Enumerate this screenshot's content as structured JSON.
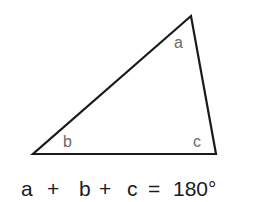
{
  "diagram": {
    "triangle": {
      "vertices": {
        "top": [
          191,
          16
        ],
        "bottom_left": [
          33,
          154
        ],
        "bottom_right": [
          216,
          154
        ]
      },
      "stroke_color": "#1a1a1a",
      "angle_label_color": "#6a6a6a"
    },
    "labels": {
      "a": "a",
      "b": "b",
      "c": "c"
    },
    "equation": {
      "text": "a + b + c = 180°",
      "a": "a",
      "plus1": "+",
      "b": "b",
      "plus2": "+",
      "c": "c",
      "equals": "=",
      "value": "180°"
    }
  }
}
